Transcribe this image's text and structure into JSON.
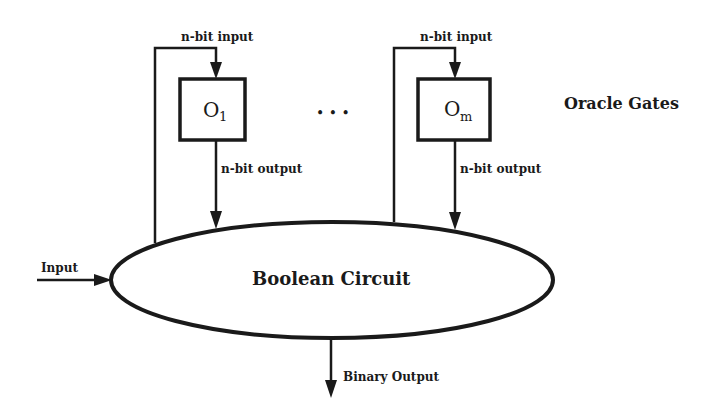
{
  "diagram": {
    "oracles": [
      {
        "label": "O",
        "subscript": "1",
        "input_label": "n-bit input",
        "output_label": "n-bit output"
      },
      {
        "label": "O",
        "subscript": "m",
        "input_label": "n-bit input",
        "output_label": "n-bit output"
      }
    ],
    "ellipsis": "• • •",
    "group_label": "Oracle Gates",
    "circuit_label": "Boolean Circuit",
    "input_label": "Input",
    "output_label": "Binary Output"
  }
}
